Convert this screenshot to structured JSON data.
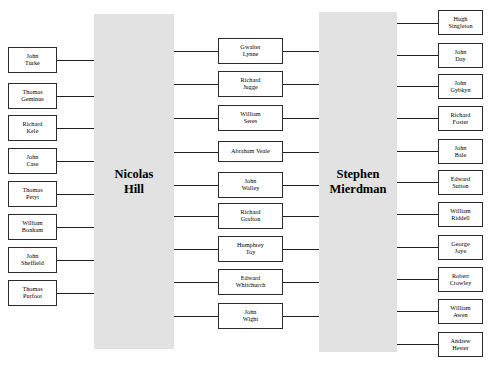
{
  "diagram": {
    "type": "network-tree",
    "title": "",
    "background_color": "#ffffff",
    "hub_fill_color": "#e2e2e2",
    "node_border_color": "#2b2b2b",
    "edge_color": "#1f1f1f",
    "hubs": [
      {
        "id": "nicolas-hill",
        "label": "Nicolas\nHill"
      },
      {
        "id": "stephen-mierdman",
        "label": "Stephen\nMierdman"
      }
    ],
    "left_column": [
      {
        "id": "john-turke",
        "label": "John\nTurke"
      },
      {
        "id": "thomas-geminus",
        "label": "Thomas\nGeminus"
      },
      {
        "id": "richard-kele",
        "label": "Richard\nKele"
      },
      {
        "id": "john-case",
        "label": "John\nCase"
      },
      {
        "id": "thomas-petyt",
        "label": "Thomas\nPetyt"
      },
      {
        "id": "william-bonham",
        "label": "William\nBonham"
      },
      {
        "id": "john-sheffield",
        "label": "John\nSheffield"
      },
      {
        "id": "thomas-purfoot",
        "label": "Thomas\nPurfoot"
      }
    ],
    "middle_column": [
      {
        "id": "gwalter-lynne",
        "label": "Gwalter\nLynne"
      },
      {
        "id": "richard-jugge",
        "label": "Richard\nJugge"
      },
      {
        "id": "william-seres",
        "label": "William\nSeres"
      },
      {
        "id": "abraham-veale",
        "label": "Abraham Veale"
      },
      {
        "id": "john-walley",
        "label": "John\nWalley"
      },
      {
        "id": "richard-grafton",
        "label": "Richard\nGrafton"
      },
      {
        "id": "humphrey-toy",
        "label": "Humphrey\nToy"
      },
      {
        "id": "edward-whitchurch",
        "label": "Edward\nWhitchurch"
      },
      {
        "id": "john-wight",
        "label": "John\nWight"
      }
    ],
    "right_column": [
      {
        "id": "hugh-singleton",
        "label": "Hugh\nSingleton"
      },
      {
        "id": "john-day",
        "label": "John\nDay"
      },
      {
        "id": "john-gybkyn",
        "label": "John\nGybkyn"
      },
      {
        "id": "richard-foster",
        "label": "Richard\nFoster"
      },
      {
        "id": "john-bale",
        "label": "John\nBale"
      },
      {
        "id": "edward-sutton",
        "label": "Edward\nSutton"
      },
      {
        "id": "william-riddell",
        "label": "William\nRiddell"
      },
      {
        "id": "george-joye",
        "label": "George\nJoye"
      },
      {
        "id": "robert-crowley",
        "label": "Robert\nCrowley"
      },
      {
        "id": "william-awen",
        "label": "William\nAwen"
      },
      {
        "id": "andrew-hester",
        "label": "Andrew\nHester"
      }
    ]
  }
}
